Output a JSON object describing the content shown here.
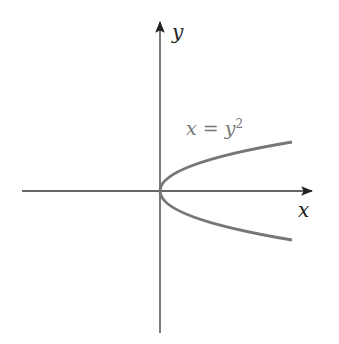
{
  "diagram": {
    "type": "parabola-graph",
    "axes": {
      "x_label": "x",
      "y_label": "y"
    },
    "curve": {
      "equation_lhs": "x",
      "equation_eq": "=",
      "equation_rhs_base": "y",
      "equation_rhs_exp": "2",
      "color": "#777777"
    },
    "axis_color": "#333333"
  }
}
